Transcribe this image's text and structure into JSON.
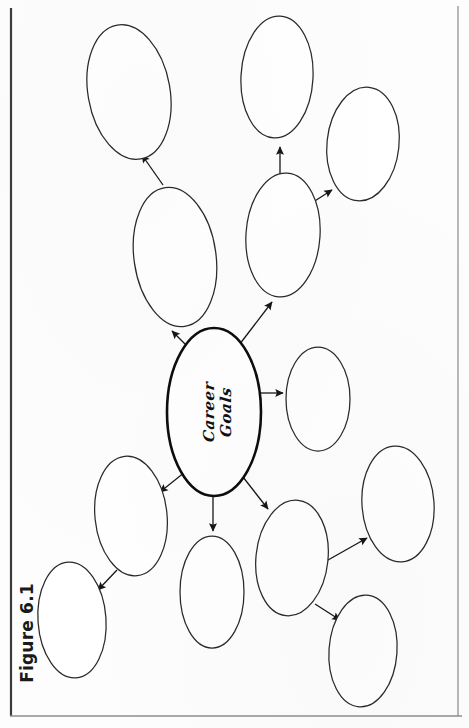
{
  "figure": {
    "caption": "Figure 6.1",
    "type": "mind-map",
    "orientation": "rotated-90-ccw",
    "background_color": "#fdfdfd",
    "stroke_color": "#1a1a1a",
    "frame": {
      "left_rule": true,
      "right_rule": true,
      "bottom_rule": true,
      "top_rule": false
    }
  },
  "central_node": {
    "id": "career-goals",
    "label_line1": "Career",
    "label_line2": "Goals",
    "label_full": "Career Goals",
    "style": "script-italic",
    "cx": 214,
    "cy": 412,
    "rx": 47,
    "ry": 84,
    "stroke_width": 2.6
  },
  "branch_nodes": [
    {
      "id": "branch-1",
      "label": "",
      "cx": 175,
      "cy": 257,
      "rx": 41,
      "ry": 70,
      "rot": -8
    },
    {
      "id": "branch-2",
      "label": "",
      "cx": 283,
      "cy": 235,
      "rx": 37,
      "ry": 62,
      "rot": 4
    },
    {
      "id": "branch-3",
      "label": "",
      "cx": 318,
      "cy": 399,
      "rx": 32,
      "ry": 52,
      "rot": 0
    },
    {
      "id": "branch-4",
      "label": "",
      "cx": 292,
      "cy": 558,
      "rx": 36,
      "ry": 58,
      "rot": 6
    },
    {
      "id": "branch-5",
      "label": "",
      "cx": 212,
      "cy": 592,
      "rx": 32,
      "ry": 56,
      "rot": 0
    },
    {
      "id": "branch-6",
      "label": "",
      "cx": 131,
      "cy": 516,
      "rx": 36,
      "ry": 60,
      "rot": -6
    }
  ],
  "leaf_nodes": [
    {
      "id": "leaf-1",
      "label": "",
      "cx": 129,
      "cy": 92,
      "rx": 41,
      "ry": 68,
      "rot": -10,
      "parent": "branch-1"
    },
    {
      "id": "leaf-2",
      "label": "",
      "cx": 277,
      "cy": 77,
      "rx": 36,
      "ry": 61,
      "rot": 3,
      "parent": "branch-2"
    },
    {
      "id": "leaf-3",
      "label": "",
      "cx": 363,
      "cy": 144,
      "rx": 36,
      "ry": 57,
      "rot": 6,
      "parent": "branch-2"
    },
    {
      "id": "leaf-4",
      "label": "",
      "cx": 398,
      "cy": 504,
      "rx": 36,
      "ry": 58,
      "rot": -4,
      "parent": "branch-4"
    },
    {
      "id": "leaf-5",
      "label": "",
      "cx": 363,
      "cy": 651,
      "rx": 34,
      "ry": 56,
      "rot": 4,
      "parent": "branch-4"
    },
    {
      "id": "leaf-6",
      "label": "",
      "cx": 72,
      "cy": 620,
      "rx": 34,
      "ry": 58,
      "rot": -4,
      "parent": "branch-6"
    }
  ],
  "connectors": [
    {
      "id": "arrow-center-to-branch1",
      "from": "career-goals",
      "to": "branch-1"
    },
    {
      "id": "arrow-center-to-branch2",
      "from": "career-goals",
      "to": "branch-2"
    },
    {
      "id": "arrow-center-to-branch3",
      "from": "career-goals",
      "to": "branch-3"
    },
    {
      "id": "arrow-center-to-branch4",
      "from": "career-goals",
      "to": "branch-4"
    },
    {
      "id": "arrow-center-to-branch5",
      "from": "career-goals",
      "to": "branch-5"
    },
    {
      "id": "arrow-center-to-branch6",
      "from": "career-goals",
      "to": "branch-6"
    },
    {
      "id": "arrow-branch1-to-leaf1",
      "from": "branch-1",
      "to": "leaf-1"
    },
    {
      "id": "arrow-branch2-to-leaf2",
      "from": "branch-2",
      "to": "leaf-2"
    },
    {
      "id": "arrow-branch2-to-leaf3",
      "from": "branch-2",
      "to": "leaf-3"
    },
    {
      "id": "arrow-branch4-to-leaf4",
      "from": "branch-4",
      "to": "leaf-4"
    },
    {
      "id": "arrow-branch4-to-leaf5",
      "from": "branch-4",
      "to": "leaf-5"
    },
    {
      "id": "arrow-branch6-to-leaf6",
      "from": "branch-6",
      "to": "leaf-6"
    }
  ]
}
